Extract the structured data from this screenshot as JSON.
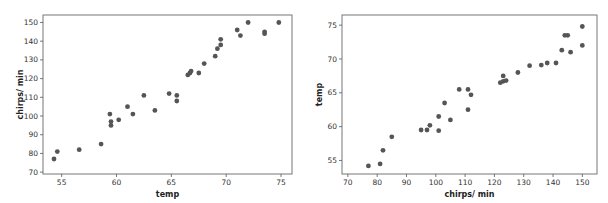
{
  "chart_data": [
    {
      "type": "scatter",
      "title": "",
      "xlabel": "temp",
      "ylabel": "chirps/ min",
      "xlim": [
        53.3,
        76
      ],
      "ylim": [
        69,
        154
      ],
      "xticks": [
        55,
        60,
        65,
        70,
        75
      ],
      "yticks": [
        70,
        80,
        90,
        100,
        110,
        120,
        130,
        140,
        150
      ],
      "grid": false,
      "legend": null,
      "marker_color": "#555555",
      "points": [
        [
          54.3,
          77
        ],
        [
          54.6,
          81
        ],
        [
          56.6,
          82
        ],
        [
          58.6,
          85
        ],
        [
          59.4,
          101
        ],
        [
          59.5,
          97
        ],
        [
          59.5,
          95
        ],
        [
          60.2,
          98
        ],
        [
          61.0,
          105
        ],
        [
          61.5,
          101
        ],
        [
          62.5,
          111
        ],
        [
          63.5,
          103
        ],
        [
          64.8,
          112
        ],
        [
          65.5,
          111
        ],
        [
          65.5,
          108
        ],
        [
          66.5,
          122
        ],
        [
          66.7,
          123
        ],
        [
          66.8,
          124
        ],
        [
          67.5,
          123
        ],
        [
          68.0,
          128
        ],
        [
          69.0,
          132
        ],
        [
          69.2,
          136
        ],
        [
          69.5,
          138
        ],
        [
          69.5,
          141
        ],
        [
          71.0,
          146
        ],
        [
          71.3,
          143
        ],
        [
          72.0,
          150
        ],
        [
          73.5,
          145
        ],
        [
          73.5,
          144
        ],
        [
          74.8,
          150
        ]
      ]
    },
    {
      "type": "scatter",
      "title": "",
      "xlabel": "chirps/ min",
      "ylabel": "temp",
      "xlim": [
        68,
        155
      ],
      "ylim": [
        53,
        76.5
      ],
      "xticks": [
        70,
        80,
        90,
        100,
        110,
        120,
        130,
        140,
        150
      ],
      "yticks": [
        55,
        60,
        65,
        70,
        75
      ],
      "grid": false,
      "legend": null,
      "marker_color": "#555555",
      "points": [
        [
          77,
          54.2
        ],
        [
          81,
          54.5
        ],
        [
          82,
          56.5
        ],
        [
          85,
          58.5
        ],
        [
          95,
          59.5
        ],
        [
          97,
          59.5
        ],
        [
          98,
          60.2
        ],
        [
          101,
          59.4
        ],
        [
          101,
          61.5
        ],
        [
          103,
          63.5
        ],
        [
          105,
          61
        ],
        [
          108,
          65.5
        ],
        [
          111,
          65.5
        ],
        [
          111,
          62.5
        ],
        [
          112,
          64.7
        ],
        [
          122,
          66.5
        ],
        [
          123,
          66.7
        ],
        [
          123,
          67.5
        ],
        [
          124,
          66.8
        ],
        [
          128,
          68
        ],
        [
          132,
          69
        ],
        [
          136,
          69.1
        ],
        [
          138,
          69.4
        ],
        [
          141,
          69.4
        ],
        [
          143,
          71.3
        ],
        [
          144,
          73.5
        ],
        [
          145,
          73.5
        ],
        [
          146,
          71
        ],
        [
          150,
          74.8
        ],
        [
          150,
          72
        ]
      ]
    }
  ]
}
